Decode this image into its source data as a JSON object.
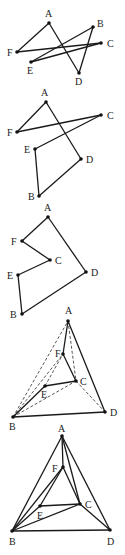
{
  "figure": {
    "panels": [
      {
        "id": "panel-1",
        "vertices": [
          {
            "name": "A",
            "x": 49,
            "y": 23,
            "lx": 45,
            "ly": 17
          },
          {
            "name": "B",
            "x": 93,
            "y": 27,
            "lx": 97,
            "ly": 27
          },
          {
            "name": "C",
            "x": 101,
            "y": 43,
            "lx": 107,
            "ly": 47
          },
          {
            "name": "F",
            "x": 17,
            "y": 52,
            "lx": 7,
            "ly": 56
          },
          {
            "name": "E",
            "x": 31,
            "y": 62,
            "lx": 27,
            "ly": 74
          },
          {
            "name": "D",
            "x": 79,
            "y": 73,
            "lx": 75,
            "ly": 85
          }
        ],
        "edges": [
          [
            "A",
            "F"
          ],
          [
            "A",
            "D"
          ],
          [
            "D",
            "B"
          ],
          [
            "B",
            "E"
          ],
          [
            "E",
            "C"
          ],
          [
            "C",
            "F"
          ]
        ],
        "dashed_edges": []
      },
      {
        "id": "panel-2",
        "vertices": [
          {
            "name": "A",
            "x": 46,
            "y": 102,
            "lx": 41,
            "ly": 96
          },
          {
            "name": "C",
            "x": 101,
            "y": 115,
            "lx": 107,
            "ly": 119
          },
          {
            "name": "F",
            "x": 17,
            "y": 132,
            "lx": 7,
            "ly": 136
          },
          {
            "name": "E",
            "x": 35,
            "y": 149,
            "lx": 24,
            "ly": 153
          },
          {
            "name": "D",
            "x": 81,
            "y": 159,
            "lx": 86,
            "ly": 163
          },
          {
            "name": "B",
            "x": 39,
            "y": 196,
            "lx": 28,
            "ly": 200
          }
        ],
        "edges": [
          [
            "A",
            "F"
          ],
          [
            "F",
            "C"
          ],
          [
            "C",
            "E"
          ],
          [
            "E",
            "B"
          ],
          [
            "B",
            "D"
          ],
          [
            "D",
            "A"
          ]
        ],
        "dashed_edges": []
      },
      {
        "id": "panel-3",
        "vertices": [
          {
            "name": "A",
            "x": 48,
            "y": 217,
            "lx": 44,
            "ly": 211
          },
          {
            "name": "F",
            "x": 22,
            "y": 241,
            "lx": 11,
            "ly": 245
          },
          {
            "name": "C",
            "x": 50,
            "y": 260,
            "lx": 55,
            "ly": 264
          },
          {
            "name": "E",
            "x": 18,
            "y": 275,
            "lx": 7,
            "ly": 279
          },
          {
            "name": "D",
            "x": 86,
            "y": 272,
            "lx": 91,
            "ly": 276
          },
          {
            "name": "B",
            "x": 22,
            "y": 314,
            "lx": 10,
            "ly": 318
          }
        ],
        "edges": [
          [
            "A",
            "F"
          ],
          [
            "F",
            "C"
          ],
          [
            "C",
            "E"
          ],
          [
            "E",
            "B"
          ],
          [
            "B",
            "D"
          ],
          [
            "D",
            "A"
          ]
        ],
        "dashed_edges": []
      },
      {
        "id": "panel-4",
        "vertices": [
          {
            "name": "A",
            "x": 68,
            "y": 321,
            "lx": 65,
            "ly": 314
          },
          {
            "name": "F",
            "x": 63,
            "y": 354,
            "lx": 55,
            "ly": 357
          },
          {
            "name": "C",
            "x": 76,
            "y": 381,
            "lx": 80,
            "ly": 385
          },
          {
            "name": "E",
            "x": 45,
            "y": 386,
            "lx": 41,
            "ly": 398
          },
          {
            "name": "D",
            "x": 105,
            "y": 412,
            "lx": 110,
            "ly": 416
          },
          {
            "name": "B",
            "x": 13,
            "y": 417,
            "lx": 9,
            "ly": 430
          }
        ],
        "edges": [
          [
            "A",
            "F"
          ],
          [
            "F",
            "C"
          ],
          [
            "C",
            "E"
          ],
          [
            "E",
            "B"
          ],
          [
            "B",
            "D"
          ],
          [
            "D",
            "A"
          ]
        ],
        "dashed_edges": [
          [
            "B",
            "A"
          ],
          [
            "B",
            "F"
          ],
          [
            "B",
            "C"
          ],
          [
            "A",
            "C"
          ],
          [
            "C",
            "D"
          ],
          [
            "E",
            "F"
          ]
        ]
      },
      {
        "id": "panel-5",
        "vertices": [
          {
            "name": "A",
            "x": 62,
            "y": 436,
            "lx": 58,
            "ly": 432
          },
          {
            "name": "F",
            "x": 63,
            "y": 467,
            "lx": 52,
            "ly": 472
          },
          {
            "name": "C",
            "x": 80,
            "y": 504,
            "lx": 85,
            "ly": 508
          },
          {
            "name": "E",
            "x": 40,
            "y": 506,
            "lx": 37,
            "ly": 519
          },
          {
            "name": "B",
            "x": 12,
            "y": 531,
            "lx": 9,
            "ly": 545
          },
          {
            "name": "D",
            "x": 110,
            "y": 530,
            "lx": 107,
            "ly": 545
          }
        ],
        "edges": [
          [
            "A",
            "B"
          ],
          [
            "A",
            "D"
          ],
          [
            "B",
            "D"
          ],
          [
            "A",
            "F"
          ],
          [
            "A",
            "C"
          ],
          [
            "F",
            "C"
          ],
          [
            "F",
            "E"
          ],
          [
            "E",
            "C"
          ],
          [
            "B",
            "F"
          ],
          [
            "B",
            "E"
          ],
          [
            "B",
            "C"
          ],
          [
            "C",
            "D"
          ]
        ],
        "dashed_edges": []
      }
    ]
  }
}
